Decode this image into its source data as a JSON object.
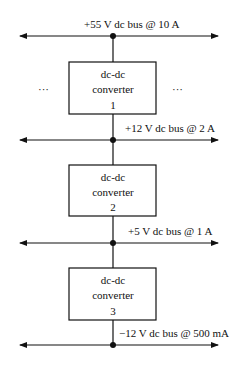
{
  "buses": [
    {
      "label": "+55 V dc bus @ 10 A"
    },
    {
      "label": "+12 V dc bus @ 2 A"
    },
    {
      "label": "+5 V dc bus @ 1 A"
    },
    {
      "label": "−12 V dc bus @ 500 mA"
    }
  ],
  "converters": [
    {
      "line1": "dc-dc",
      "line2": "converter",
      "line3": "1"
    },
    {
      "line1": "dc-dc",
      "line2": "converter",
      "line3": "2"
    },
    {
      "line1": "dc-dc",
      "line2": "converter",
      "line3": "3"
    }
  ],
  "ellipsis": {
    "left": "···",
    "right": "···"
  }
}
